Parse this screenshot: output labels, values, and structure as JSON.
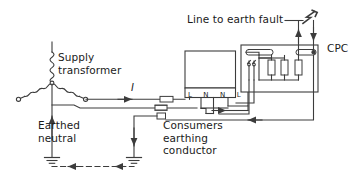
{
  "diagram": {
    "type": "electrical-schematic",
    "background_color": "#ffffff",
    "line_color": "#3c3c3c",
    "text_color": "#1a1a1a",
    "labels": {
      "line_to_earth_fault": "Line to earth fault",
      "cpc": "CPC",
      "supply_transformer": "Supply\ntransformer",
      "current": "I",
      "earthed_neutral": "Earthed\nneutral",
      "consumers_earthing_conductor": "Consumers\nearthing\nconductor",
      "terminals": "L N N L"
    },
    "terminal_sequence": [
      "L",
      "N",
      "N",
      "L"
    ],
    "components": {
      "supply_transformer": {
        "name": "Supply transformer",
        "configuration": "star (wye) connected, three windings",
        "winding_count": 3,
        "star_point_earthed": true
      },
      "consumer_unit": {
        "name": "Consumer unit / intake",
        "terminals": [
          "L",
          "N",
          "N",
          "L"
        ]
      },
      "installation": {
        "name": "Installation final circuits",
        "busbar_count": 2,
        "load_count": 3,
        "switch_count": 1,
        "cpc_terminal": "CPC"
      },
      "earth_electrodes": [
        {
          "name": "transformer-earth-electrode"
        },
        {
          "name": "consumer-earth-electrode"
        }
      ],
      "cable_joints": 3,
      "fault_symbol": "lightning-bolt"
    },
    "current_flow_arrows": [
      {
        "name": "line-conductor-flow",
        "direction": "right"
      },
      {
        "name": "consumer-unit-outgoing-flow",
        "direction": "right"
      },
      {
        "name": "fault-current-up",
        "direction": "up"
      },
      {
        "name": "cpc-return-down",
        "direction": "down"
      },
      {
        "name": "cpc-return-left",
        "direction": "left"
      },
      {
        "name": "earthing-conductor-down",
        "direction": "down"
      },
      {
        "name": "mass-of-earth-return-right",
        "direction": "left"
      },
      {
        "name": "mass-of-earth-return-left",
        "direction": "left"
      },
      {
        "name": "earthed-neutral-up",
        "direction": "up"
      }
    ]
  }
}
